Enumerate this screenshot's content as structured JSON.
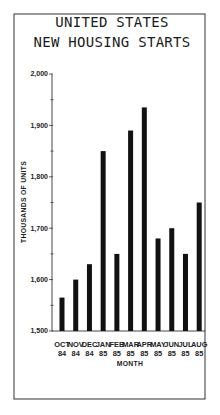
{
  "chart_data": {
    "type": "bar",
    "title": [
      "UNITED STATES",
      "NEW HOUSING STARTS"
    ],
    "xlabel": "MONTH",
    "ylabel": "THOUSANDS OF UNITS",
    "ylim": [
      1500,
      2000
    ],
    "yticks": [
      1500,
      1600,
      1700,
      1800,
      1900,
      2000
    ],
    "ytick_labels": [
      "1,500",
      "1,600",
      "1,700",
      "1,800",
      "1,900",
      "2,000"
    ],
    "minor_tick_step": 50,
    "grid": false,
    "categories": [
      {
        "month": "OCT",
        "year": "84"
      },
      {
        "month": "NOV",
        "year": "84"
      },
      {
        "month": "DEC",
        "year": "84"
      },
      {
        "month": "JAN",
        "year": "85"
      },
      {
        "month": "FEB",
        "year": "85"
      },
      {
        "month": "MAR",
        "year": "85"
      },
      {
        "month": "APR",
        "year": "85"
      },
      {
        "month": "MAY",
        "year": "85"
      },
      {
        "month": "JUN",
        "year": "85"
      },
      {
        "month": "JUL",
        "year": "85"
      },
      {
        "month": "AUG",
        "year": "85"
      }
    ],
    "values": [
      1565,
      1600,
      1630,
      1850,
      1650,
      1890,
      1935,
      1680,
      1700,
      1650,
      1750
    ],
    "bar_color": "#111111",
    "frame": true
  }
}
